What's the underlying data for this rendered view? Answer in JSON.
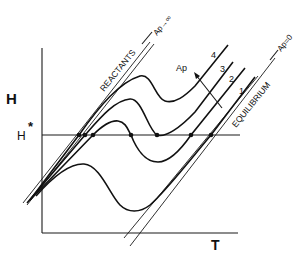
{
  "diagram": {
    "axes": {
      "y_label": "H",
      "x_label": "T",
      "reference_label": "H*",
      "reference_label_base": "H",
      "reference_label_sup": "*"
    },
    "asymptotes": {
      "reactants": {
        "label": "REACTANTS",
        "limit_label": "Ap→∞"
      },
      "equilibrium": {
        "label": "EQUILIBRIUM",
        "limit_label": "Ap=0"
      }
    },
    "curves": [
      {
        "id": "1",
        "label": "1"
      },
      {
        "id": "2",
        "label": "2"
      },
      {
        "id": "3",
        "label": "3"
      },
      {
        "id": "4",
        "label": "4"
      }
    ],
    "arrow": {
      "label": "Ap",
      "direction": "increasing Ap"
    },
    "intersection_points_count": 7,
    "colors": {
      "ink": "#111111",
      "background": "#ffffff"
    }
  }
}
